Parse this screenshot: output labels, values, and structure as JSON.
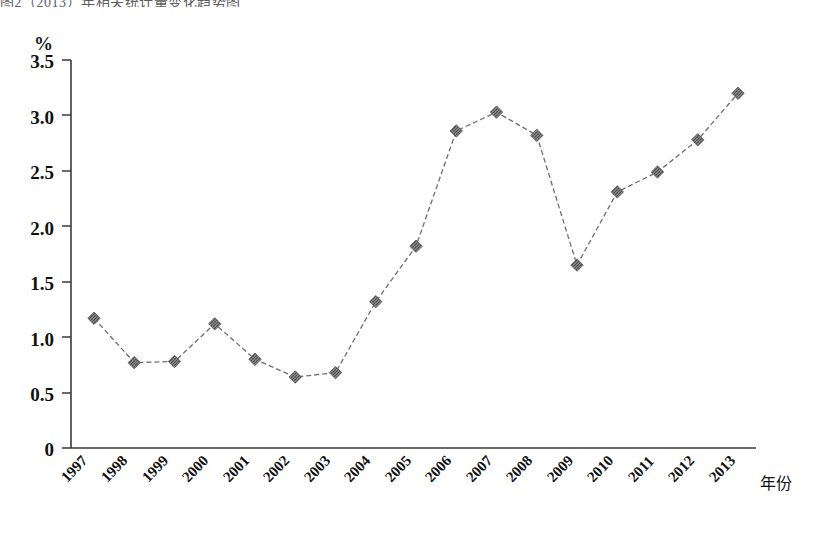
{
  "top_caption_fragment": "图2（2013）年相关统计量变化趋势图",
  "chart_data": {
    "type": "line",
    "title": "",
    "subtitle": "",
    "xlabel": "年份",
    "ylabel": "%",
    "ylim": [
      0,
      3.5
    ],
    "ytick_labels": [
      "0",
      "0.5",
      "1.0",
      "1.5",
      "2.0",
      "2.5",
      "3.0",
      "3.5"
    ],
    "ytick_values": [
      0,
      0.5,
      1.0,
      1.5,
      2.0,
      2.5,
      3.0,
      3.5
    ],
    "grid": false,
    "legend": "none",
    "marker": "diamond",
    "line_style": "dashed",
    "series_color": "#6e6e6e",
    "categories": [
      "1997",
      "1998",
      "1999",
      "2000",
      "2001",
      "2002",
      "2003",
      "2004",
      "2005",
      "2006",
      "2007",
      "2008",
      "2009",
      "2010",
      "2011",
      "2012",
      "2013"
    ],
    "values": [
      1.17,
      0.77,
      0.78,
      1.12,
      0.8,
      0.64,
      0.68,
      1.32,
      1.82,
      2.86,
      3.03,
      2.82,
      1.65,
      2.31,
      2.49,
      2.78,
      3.2
    ]
  },
  "axis": {
    "unit_label": "%",
    "x_axis_name": "年份"
  }
}
